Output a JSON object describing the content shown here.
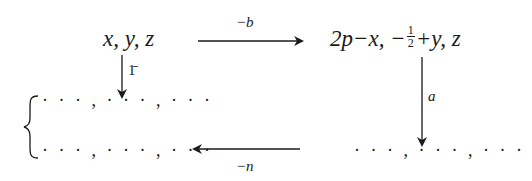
{
  "diagram": {
    "type": "symmetry-operation-diagram",
    "nodes": {
      "top_left": {
        "text": "x, y, z"
      },
      "top_right": {
        "prefix": "2p−x, −",
        "frac_num": "1",
        "frac_den": "2",
        "suffix": "+y, z"
      },
      "bottom_right": {
        "text": "…, …, …"
      },
      "middle_left": {
        "text": "· · · , · · · , · · ·"
      },
      "bottom_left": {
        "text": "· · · , · · · , · · ·"
      },
      "bottom_right_dots": {
        "text": "· · · , · · · , · · ·"
      }
    },
    "edges": [
      {
        "from": "top_left",
        "to": "top_right",
        "label": "−b",
        "direction": "right"
      },
      {
        "from": "top_left",
        "to": "middle_left",
        "label": "1̄",
        "direction": "down"
      },
      {
        "from": "top_right",
        "to": "bottom_right",
        "label": "a",
        "direction": "down"
      },
      {
        "from": "bottom_right",
        "to": "bottom_left",
        "label": "−n",
        "direction": "left"
      }
    ],
    "brace": {
      "groups": [
        "middle_left",
        "bottom_left"
      ],
      "side": "left"
    }
  }
}
